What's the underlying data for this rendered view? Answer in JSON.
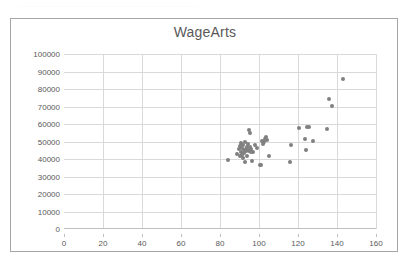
{
  "document": {
    "top_strip_present": true
  },
  "chart": {
    "title": "WageArts",
    "marker_color": "#808080",
    "gridline_color": "#d9d9d9",
    "axis_color": "#bfbfbf",
    "border_color": "#a6a6a6",
    "text_color": "#595959"
  },
  "chart_data": {
    "type": "scatter",
    "title": "WageArts",
    "xlabel": "",
    "ylabel": "",
    "xlim": [
      0,
      160
    ],
    "ylim": [
      0,
      100000
    ],
    "xticks": [
      0,
      20,
      40,
      60,
      80,
      100,
      120,
      140,
      160
    ],
    "yticks": [
      0,
      10000,
      20000,
      30000,
      40000,
      50000,
      60000,
      70000,
      80000,
      90000,
      100000
    ],
    "xtick_labels": [
      "0",
      "20",
      "40",
      "60",
      "80",
      "100",
      "120",
      "140",
      "160"
    ],
    "ytick_labels": [
      "0",
      "10000",
      "20000",
      "30000",
      "40000",
      "50000",
      "60000",
      "70000",
      "80000",
      "90000",
      "100000"
    ],
    "grid": true,
    "grid_axis": "both",
    "legend": false,
    "legend_position": "none",
    "series": [
      {
        "name": "WageArts",
        "marker": "circle",
        "color": "#808080",
        "points": [
          [
            84.0,
            39500
          ],
          [
            88.5,
            43000
          ],
          [
            89.5,
            45500
          ],
          [
            90.0,
            41500
          ],
          [
            90.5,
            47500
          ],
          [
            90.8,
            49000
          ],
          [
            91.0,
            44000
          ],
          [
            91.2,
            42500
          ],
          [
            91.5,
            46500
          ],
          [
            91.8,
            40500
          ],
          [
            92.0,
            48000
          ],
          [
            92.2,
            45000
          ],
          [
            92.5,
            43500
          ],
          [
            92.8,
            38500
          ],
          [
            93.0,
            50000
          ],
          [
            93.2,
            44500
          ],
          [
            93.5,
            46000
          ],
          [
            93.8,
            47000
          ],
          [
            94.0,
            42000
          ],
          [
            94.2,
            45200
          ],
          [
            94.5,
            48500
          ],
          [
            94.8,
            44800
          ],
          [
            95.0,
            56500
          ],
          [
            95.2,
            55000
          ],
          [
            95.5,
            46800
          ],
          [
            95.8,
            43800
          ],
          [
            96.0,
            45800
          ],
          [
            96.5,
            39000
          ],
          [
            97.0,
            44200
          ],
          [
            98.0,
            47800
          ],
          [
            99.0,
            46200
          ],
          [
            100.5,
            36500
          ],
          [
            101.0,
            36800
          ],
          [
            101.5,
            50500
          ],
          [
            102.0,
            48800
          ],
          [
            102.5,
            49500
          ],
          [
            103.0,
            51500
          ],
          [
            103.5,
            52500
          ],
          [
            104.0,
            51000
          ],
          [
            105.0,
            41800
          ],
          [
            116.0,
            38500
          ],
          [
            116.5,
            47800
          ],
          [
            120.5,
            57500
          ],
          [
            123.5,
            51500
          ],
          [
            124.0,
            45200
          ],
          [
            124.5,
            58500
          ],
          [
            125.5,
            58500
          ],
          [
            127.5,
            50200
          ],
          [
            135.0,
            57000
          ],
          [
            136.0,
            74500
          ],
          [
            137.5,
            70500
          ],
          [
            143.0,
            86000
          ]
        ]
      }
    ]
  }
}
